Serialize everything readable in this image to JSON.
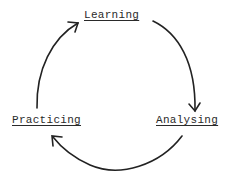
{
  "diagram": {
    "type": "cycle",
    "nodes": [
      {
        "id": "learning",
        "label": "Learning"
      },
      {
        "id": "analysing",
        "label": "Analysing"
      },
      {
        "id": "practicing",
        "label": "Practicing"
      }
    ],
    "edges": [
      {
        "from": "learning",
        "to": "analysing"
      },
      {
        "from": "analysing",
        "to": "practicing"
      },
      {
        "from": "practicing",
        "to": "learning"
      }
    ],
    "colors": {
      "stroke": "#222222",
      "text": "#2a2a2a",
      "background": "#ffffff"
    }
  }
}
